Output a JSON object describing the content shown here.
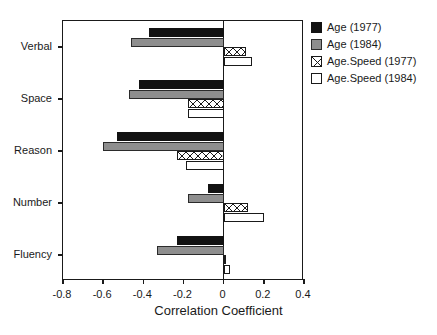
{
  "chart_data": {
    "type": "bar",
    "orientation": "horizontal",
    "title": "",
    "xlabel": "Correlation Coefficient",
    "ylabel": "",
    "xlim": [
      -0.8,
      0.4
    ],
    "ylim": [
      0,
      5
    ],
    "grid": false,
    "legend_position": "right-outside",
    "xticks": [
      -0.8,
      -0.6,
      -0.4,
      -0.2,
      0,
      0.2,
      0.4
    ],
    "xtick_labels": [
      "-0.8",
      "-0.6",
      "-0.4",
      "-0.2",
      "0",
      "0.2",
      "0.4"
    ],
    "categories": [
      "Verbal",
      "Space",
      "Reason",
      "Number",
      "Fluency"
    ],
    "series": [
      {
        "name": "Age (1977)",
        "fill": "black",
        "color": "#121212",
        "values": [
          -0.37,
          -0.42,
          -0.53,
          -0.08,
          -0.23
        ]
      },
      {
        "name": "Age (1984)",
        "fill": "gray",
        "color": "#8e8e8e",
        "values": [
          -0.46,
          -0.47,
          -0.6,
          -0.18,
          -0.33
        ]
      },
      {
        "name": "Age.Speed (1977)",
        "fill": "crosshatch",
        "color": "#ffffff",
        "values": [
          0.11,
          -0.18,
          -0.23,
          0.12,
          0.01
        ]
      },
      {
        "name": "Age.Speed (1984)",
        "fill": "white",
        "color": "#ffffff",
        "values": [
          0.14,
          -0.18,
          -0.19,
          0.2,
          0.03
        ]
      }
    ]
  },
  "legend": {
    "items": [
      {
        "label": "Age (1977)",
        "swatch": "black-square-icon"
      },
      {
        "label": "Age (1984)",
        "swatch": "gray-square-icon"
      },
      {
        "label": "Age.Speed (1977)",
        "swatch": "crosshatch-square-icon"
      },
      {
        "label": "Age.Speed (1984)",
        "swatch": "white-square-icon"
      }
    ]
  }
}
